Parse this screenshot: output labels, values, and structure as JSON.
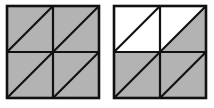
{
  "figures": [
    {
      "id": "left",
      "grid": "2x2",
      "cells": [
        {
          "row": 0,
          "col": 0,
          "upper_triangle": "shaded",
          "lower_triangle": "shaded"
        },
        {
          "row": 0,
          "col": 1,
          "upper_triangle": "shaded",
          "lower_triangle": "shaded"
        },
        {
          "row": 1,
          "col": 0,
          "upper_triangle": "shaded",
          "lower_triangle": "shaded"
        },
        {
          "row": 1,
          "col": 1,
          "upper_triangle": "shaded",
          "lower_triangle": "shaded"
        }
      ],
      "shaded_triangles": 8,
      "total_triangles": 8
    },
    {
      "id": "right",
      "grid": "2x2",
      "cells": [
        {
          "row": 0,
          "col": 0,
          "upper_triangle": "white",
          "lower_triangle": "white"
        },
        {
          "row": 0,
          "col": 1,
          "upper_triangle": "white",
          "lower_triangle": "shaded"
        },
        {
          "row": 1,
          "col": 0,
          "upper_triangle": "shaded",
          "lower_triangle": "shaded"
        },
        {
          "row": 1,
          "col": 1,
          "upper_triangle": "shaded",
          "lower_triangle": "shaded"
        }
      ],
      "shaded_triangles": 5,
      "total_triangles": 8
    }
  ],
  "colors": {
    "shaded": "#b3b3b3",
    "white": "#ffffff",
    "line": "#111111"
  }
}
